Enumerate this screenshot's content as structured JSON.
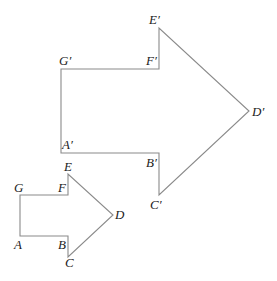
{
  "figure": {
    "colors": {
      "stroke": "#8a8a8a",
      "label": "#222222",
      "background": "#ffffff"
    }
  },
  "small_polygon": {
    "name": "ABCDEFG",
    "vertices": [
      {
        "label": "A",
        "x": 20,
        "y": 236
      },
      {
        "label": "B",
        "x": 68,
        "y": 236
      },
      {
        "label": "C",
        "x": 68,
        "y": 257
      },
      {
        "label": "D",
        "x": 113,
        "y": 215
      },
      {
        "label": "E",
        "x": 68,
        "y": 174
      },
      {
        "label": "F",
        "x": 68,
        "y": 195
      },
      {
        "label": "G",
        "x": 20,
        "y": 195
      }
    ],
    "labels": {
      "A": "A",
      "B": "B",
      "C": "C",
      "D": "D",
      "E": "E",
      "F": "F",
      "G": "G"
    }
  },
  "large_polygon": {
    "name": "A'B'C'D'E'F'G'",
    "vertices": [
      {
        "label": "A'",
        "x": 61,
        "y": 153
      },
      {
        "label": "B'",
        "x": 159,
        "y": 153
      },
      {
        "label": "C'",
        "x": 159,
        "y": 195
      },
      {
        "label": "D'",
        "x": 249,
        "y": 111
      },
      {
        "label": "E'",
        "x": 159,
        "y": 28
      },
      {
        "label": "F'",
        "x": 159,
        "y": 69
      },
      {
        "label": "G'",
        "x": 61,
        "y": 69
      }
    ],
    "labels": {
      "A": "A′",
      "B": "B′",
      "C": "C′",
      "D": "D′",
      "E": "E′",
      "F": "F′",
      "G": "G′"
    }
  }
}
